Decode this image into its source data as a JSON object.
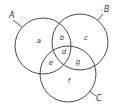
{
  "diagram": {
    "type": "venn-3",
    "stroke_color": "#333333",
    "background": "#ffffff",
    "sets": [
      {
        "id": "A",
        "label": "A",
        "cx": 43,
        "cy": 46,
        "r": 28,
        "label_x": 9,
        "label_y": 18,
        "leader": [
          13,
          20,
          22,
          27
        ]
      },
      {
        "id": "B",
        "label": "B",
        "cx": 80,
        "cy": 42,
        "r": 28,
        "label_x": 104,
        "label_y": 12,
        "leader": [
          103,
          14,
          98,
          20
        ]
      },
      {
        "id": "C",
        "label": "C",
        "cx": 68,
        "cy": 74,
        "r": 28,
        "label_x": 96,
        "label_y": 101,
        "leader": [
          96,
          96,
          89,
          91
        ]
      }
    ],
    "regions": [
      {
        "label": "a",
        "x": 39,
        "y": 41,
        "sets": [
          "A"
        ]
      },
      {
        "label": "b",
        "x": 62,
        "y": 38,
        "sets": [
          "A",
          "B"
        ]
      },
      {
        "label": "c",
        "x": 86,
        "y": 38,
        "sets": [
          "B"
        ]
      },
      {
        "label": "d",
        "x": 64,
        "y": 52,
        "sets": [
          "A",
          "B",
          "C"
        ]
      },
      {
        "label": "e",
        "x": 51,
        "y": 63,
        "sets": [
          "A",
          "C"
        ]
      },
      {
        "label": "f",
        "x": 69,
        "y": 81,
        "sets": [
          "C"
        ]
      },
      {
        "label": "g",
        "x": 78,
        "y": 62,
        "sets": [
          "B",
          "C"
        ]
      }
    ]
  }
}
